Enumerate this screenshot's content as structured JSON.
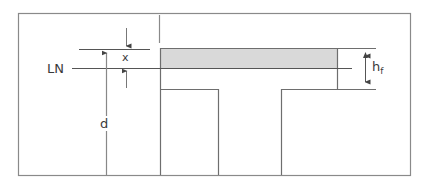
{
  "diagram": {
    "type": "T-beam cross-section",
    "labels": {
      "neutral_line": "LN",
      "neutral_axis_depth": "x",
      "effective_depth": "d",
      "flange_thickness_main": "h",
      "flange_thickness_sub": "f"
    },
    "colors": {
      "line": "#6e6e6e",
      "frame": "#8a8a8a",
      "compression_zone_fill": "#d9d9d9",
      "text": "#3a3a3a",
      "background": "#ffffff"
    }
  }
}
